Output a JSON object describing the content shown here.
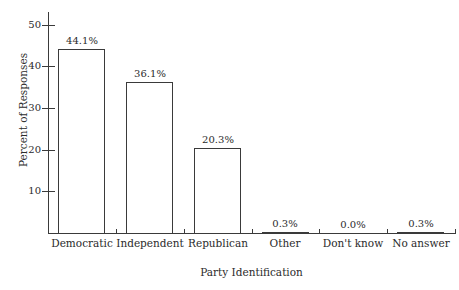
{
  "chart_data": {
    "type": "bar",
    "title": "",
    "xlabel": "Party Identification",
    "ylabel": "Percent of Responses",
    "categories": [
      "Democratic",
      "Independent",
      "Republican",
      "Other",
      "Don't know",
      "No answer"
    ],
    "values": [
      44.1,
      36.1,
      20.3,
      0.3,
      0.0,
      0.3
    ],
    "data_labels": [
      "44.1%",
      "36.1%",
      "20.3%",
      "0.3%",
      "0.0%",
      "0.3%"
    ],
    "ylim": [
      0,
      53
    ],
    "yticks": [
      10,
      20,
      30,
      40,
      50
    ],
    "ytick_labels": [
      "10",
      "20",
      "30",
      "40",
      "50"
    ],
    "grid": false,
    "legend": false,
    "bar_fill": "#ffffff",
    "bar_edge": "#3a3a3a",
    "axis_color": "#3a3a3a",
    "text_color": "#2b2b2b"
  }
}
